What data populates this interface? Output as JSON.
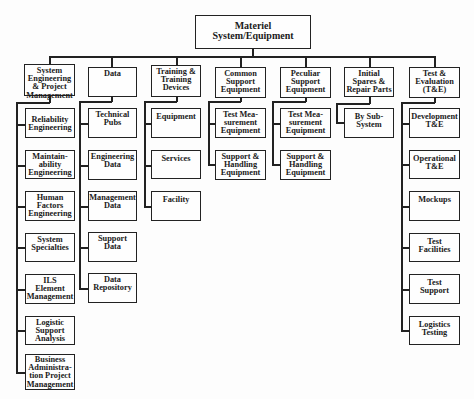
{
  "root": {
    "label": "Materiel\nSystem/Equipment"
  },
  "branches": [
    {
      "label": "System\nEngineering\n& Project\nManagement",
      "children": [
        "Reliability\nEngineering",
        "Maintain-\nability\nEngineering",
        "Human\nFactors\nEngineering",
        "System\nSpecialties",
        "ILS\nElement\nManagement",
        "Logistic\nSupport\nAnalysis",
        "Business\nAdministra-\ntion Project\nManagement"
      ]
    },
    {
      "label": "Data",
      "children": [
        "Technical\nPubs",
        "Engineering\nData",
        "Management\nData",
        "Support\nData",
        "Data\nRepository"
      ]
    },
    {
      "label": "Training &\nTraining\nDevices",
      "children": [
        "Equipment",
        "Services",
        "Facility"
      ]
    },
    {
      "label": "Common\nSupport\nEquipment",
      "children": [
        "Test Mea-\nsurement\nEquipment",
        "Support &\nHandling\nEquipment"
      ]
    },
    {
      "label": "Peculiar\nSupport\nEquipment",
      "children": [
        "Test Mea-\nsurement\nEquipment",
        "Support &\nHandling\nEquipment"
      ]
    },
    {
      "label": "Initial\nSpares &\nRepair Parts",
      "children": [
        "By Sub-\nSystem"
      ]
    },
    {
      "label": "Test &\nEvaluation\n(T&E)",
      "children": [
        "Development\nT&E",
        "Operational\nT&E",
        "Mockups",
        "Test\nFacilities",
        "Test\nSupport",
        "Logistics\nTesting"
      ]
    }
  ]
}
